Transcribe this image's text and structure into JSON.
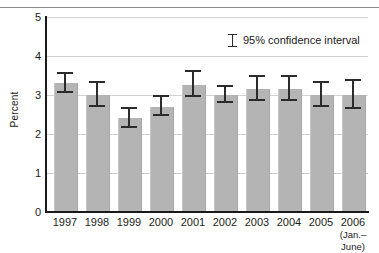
{
  "chart_data": {
    "type": "bar",
    "title": "",
    "subtitle": "",
    "xlabel": "",
    "ylabel": "Percent",
    "ylim": [
      0,
      5
    ],
    "yticks": [
      0,
      1,
      2,
      3,
      4,
      5
    ],
    "ytick_labels": [
      "0",
      "1",
      "2",
      "3",
      "4",
      "5"
    ],
    "grid": "horizontal",
    "legend_position": "top-right",
    "categories": [
      "1997",
      "1998",
      "1999",
      "2000",
      "2001",
      "2002",
      "2003",
      "2004",
      "2005",
      "2006"
    ],
    "category_sublabels": [
      "",
      "",
      "",
      "",
      "",
      "",
      "",
      "",
      "",
      "(Jan.–June)"
    ],
    "values": [
      3.3,
      3.0,
      2.4,
      2.7,
      3.25,
      3.0,
      3.15,
      3.15,
      3.0,
      3.0
    ],
    "error_low": [
      3.05,
      2.7,
      2.15,
      2.45,
      2.95,
      2.8,
      2.85,
      2.85,
      2.7,
      2.65
    ],
    "error_high": [
      3.55,
      3.3,
      2.65,
      2.95,
      3.6,
      3.2,
      3.45,
      3.45,
      3.3,
      3.35
    ],
    "series": [
      {
        "name": "Percent",
        "values": [
          3.3,
          3.0,
          2.4,
          2.7,
          3.25,
          3.0,
          3.15,
          3.15,
          3.0,
          3.0
        ]
      }
    ]
  },
  "legend": {
    "label": "95% confidence interval",
    "glyph": "error-bar-icon"
  },
  "colors": {
    "bar_fill": "#b4b4b4",
    "error_bar": "#2b2b2b",
    "axis": "#1a1a1a",
    "gridline": "#d2d2d2",
    "text": "#1a1a1a",
    "background": "#ffffff"
  }
}
